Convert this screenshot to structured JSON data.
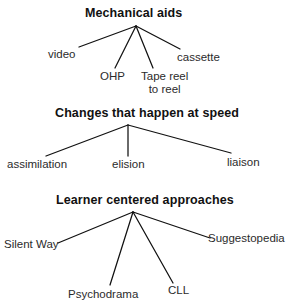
{
  "document": {
    "type": "tree-diagram-set",
    "background_color": "#ffffff",
    "line_color": "#111111",
    "text_color": "#2b2b2b",
    "title_color": "#111111"
  },
  "diagrams": [
    {
      "id": "mechanical-aids",
      "title": "Mechanical aids",
      "leaves": [
        {
          "label": "video"
        },
        {
          "label": "OHP"
        },
        {
          "label": "Tape reel",
          "label2": "to reel"
        },
        {
          "label": "cassette"
        }
      ]
    },
    {
      "id": "changes-that-happen-at-speed",
      "title": "Changes that happen at speed",
      "leaves": [
        {
          "label": "assimilation"
        },
        {
          "label": "elision"
        },
        {
          "label": "liaison"
        }
      ]
    },
    {
      "id": "learner-centered-approaches",
      "title": "Learner centered approaches",
      "leaves": [
        {
          "label": "Silent Way"
        },
        {
          "label": "Psychodrama"
        },
        {
          "label": "CLL"
        },
        {
          "label": "Suggestopedia"
        }
      ]
    }
  ]
}
